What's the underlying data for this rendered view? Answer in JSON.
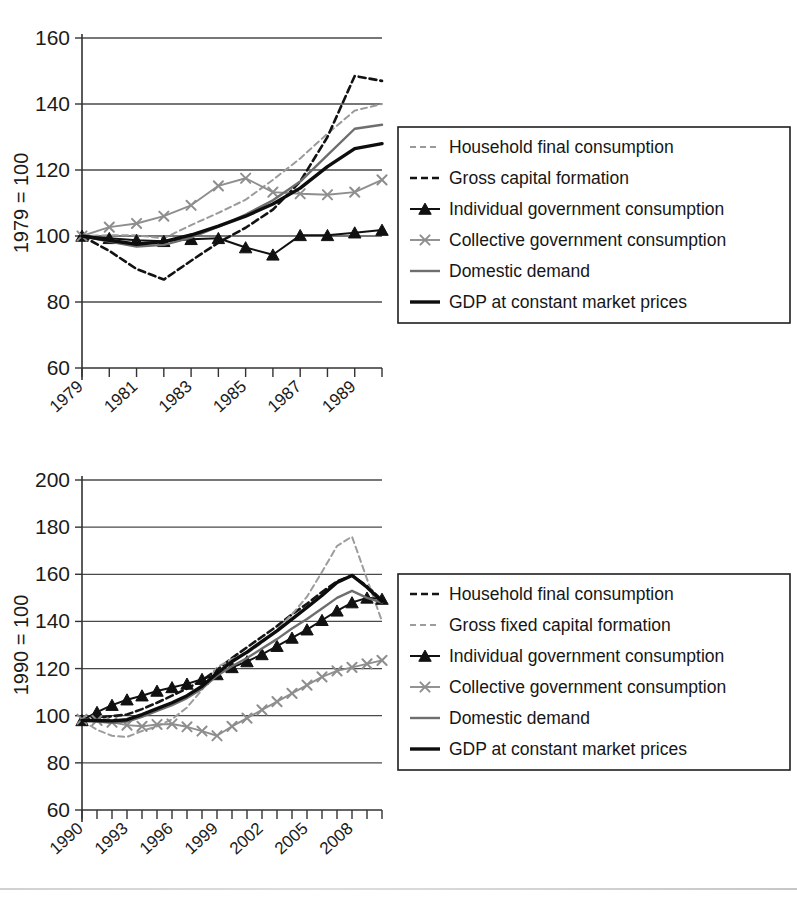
{
  "figure": {
    "background_color": "#ffffff",
    "series_colors": {
      "household": "#9a9a9a",
      "gross_capital": "#121212",
      "individual_gov": "#111111",
      "collective_gov": "#8e8e8e",
      "domestic_demand": "#6e6e6e",
      "gdp": "#0d0d0d"
    }
  },
  "chart_data": [
    {
      "id": "chart-top",
      "type": "line",
      "title": "",
      "xlabel": "",
      "ylabel": "1979 = 100",
      "xlim": [
        1979,
        1990
      ],
      "ylim": [
        60,
        160
      ],
      "yticks": [
        60,
        80,
        100,
        120,
        140,
        160
      ],
      "xticks": [
        1979,
        1980,
        1981,
        1982,
        1983,
        1984,
        1985,
        1986,
        1987,
        1988,
        1989,
        1990
      ],
      "xtick_labels": [
        "1979",
        "",
        "1981",
        "",
        "1983",
        "",
        "1985",
        "",
        "1987",
        "",
        "1989",
        ""
      ],
      "grid": "horizontal",
      "legend_position": "right",
      "x": [
        1979,
        1980,
        1981,
        1982,
        1983,
        1984,
        1985,
        1986,
        1987,
        1988,
        1989,
        1990
      ],
      "series": [
        {
          "name": "Household final consumption",
          "key": "household",
          "style": "dashed-light",
          "color": "#9a9a9a",
          "values": [
            100.0,
            100.2,
            100.2,
            99.3,
            103.3,
            107.0,
            111.0,
            117.0,
            123.5,
            131.0,
            138.0,
            140.0
          ]
        },
        {
          "name": "Gross capital formation",
          "key": "gross_capital",
          "style": "dashed-dark",
          "color": "#121212",
          "values": [
            100.0,
            95.5,
            90.0,
            86.8,
            92.5,
            98.0,
            102.5,
            108.0,
            116.5,
            130.0,
            148.5,
            147.0
          ]
        },
        {
          "name": "Individual government consumption",
          "key": "individual_gov",
          "style": "triangle",
          "color": "#111111",
          "values": [
            100.0,
            99.3,
            98.7,
            98.4,
            99.0,
            99.3,
            96.5,
            94.3,
            100.2,
            100.2,
            101.0,
            101.8,
            103.0
          ]
        },
        {
          "name": "Collective government consumption",
          "key": "collective_gov",
          "style": "cross",
          "color": "#8e8e8e",
          "values": [
            100.0,
            102.7,
            103.8,
            106.0,
            109.3,
            115.2,
            117.5,
            113.3,
            112.8,
            112.5,
            113.3,
            117.0
          ]
        },
        {
          "name": "Domestic demand",
          "key": "domestic_demand",
          "style": "solid-medium",
          "color": "#6e6e6e",
          "values": [
            100.0,
            98.3,
            96.8,
            97.3,
            99.5,
            102.8,
            106.5,
            110.8,
            116.5,
            124.5,
            132.5,
            133.7
          ]
        },
        {
          "name": "GDP at constant market prices",
          "key": "gdp",
          "style": "solid-heavy",
          "color": "#0d0d0d",
          "values": [
            100.0,
            98.7,
            97.5,
            98.3,
            100.3,
            103.0,
            106.0,
            109.7,
            114.5,
            121.0,
            126.5,
            128.0
          ]
        }
      ]
    },
    {
      "id": "chart-bottom",
      "type": "line",
      "title": "",
      "xlabel": "",
      "ylabel": "1990 = 100",
      "xlim": [
        1990,
        2010
      ],
      "ylim": [
        60,
        200
      ],
      "yticks": [
        60,
        80,
        100,
        120,
        140,
        160,
        180,
        200
      ],
      "xticks": [
        1990,
        1991,
        1992,
        1993,
        1994,
        1995,
        1996,
        1997,
        1998,
        1999,
        2000,
        2001,
        2002,
        2003,
        2004,
        2005,
        2006,
        2007,
        2008,
        2009,
        2010
      ],
      "xtick_labels": [
        "1990",
        "",
        "",
        "1993",
        "",
        "",
        "1996",
        "",
        "",
        "1999",
        "",
        "",
        "2002",
        "",
        "",
        "2005",
        "",
        "",
        "2008",
        "",
        ""
      ],
      "grid": "horizontal",
      "legend_position": "right",
      "x": [
        1990,
        1991,
        1992,
        1993,
        1994,
        1995,
        1996,
        1997,
        1998,
        1999,
        2000,
        2001,
        2002,
        2003,
        2004,
        2005,
        2006,
        2007,
        2008,
        2009,
        2010
      ],
      "series": [
        {
          "name": "Household final consumption",
          "key": "household",
          "style": "dashed-dark",
          "color": "#151515",
          "values": [
            98.0,
            99.0,
            99.8,
            100.5,
            102.8,
            105.5,
            108.5,
            111.5,
            115.0,
            119.5,
            124.5,
            129.0,
            133.5,
            138.0,
            143.0,
            147.5,
            152.5,
            157.0,
            159.5,
            155.0,
            149.0
          ]
        },
        {
          "name": "Gross fixed capital formation",
          "key": "gross_capital",
          "style": "dashed-light",
          "color": "#9c9c9c",
          "values": [
            98.0,
            94.0,
            91.5,
            91.0,
            93.5,
            95.5,
            98.5,
            103.5,
            111.0,
            120.5,
            124.0,
            126.5,
            131.0,
            136.5,
            143.0,
            150.5,
            161.0,
            172.0,
            176.0,
            158.0,
            140.0
          ]
        },
        {
          "name": "Individual government consumption",
          "key": "individual_gov",
          "style": "triangle",
          "color": "#111111",
          "values": [
            98.0,
            101.5,
            104.5,
            106.8,
            108.5,
            110.5,
            112.0,
            113.5,
            115.5,
            117.5,
            120.5,
            123.0,
            126.0,
            129.5,
            133.0,
            136.5,
            140.5,
            144.5,
            148.0,
            150.0,
            149.5
          ]
        },
        {
          "name": "Collective government consumption",
          "key": "collective_gov",
          "style": "cross",
          "color": "#8e8e8e",
          "values": [
            98.5,
            98.0,
            97.2,
            96.0,
            95.5,
            96.3,
            96.5,
            95.3,
            93.5,
            91.5,
            95.5,
            99.0,
            102.5,
            106.0,
            109.5,
            113.0,
            116.5,
            119.0,
            120.5,
            122.0,
            123.5
          ]
        },
        {
          "name": "Domestic demand",
          "key": "domestic_demand",
          "style": "solid-medium",
          "color": "#6e6e6e",
          "values": [
            98.0,
            97.5,
            97.0,
            97.5,
            99.5,
            102.0,
            104.5,
            107.5,
            111.5,
            117.0,
            121.0,
            124.5,
            128.5,
            132.5,
            137.0,
            141.0,
            145.5,
            150.0,
            153.0,
            150.0,
            148.0
          ]
        },
        {
          "name": "GDP at constant market prices",
          "key": "gdp",
          "style": "solid-heavy",
          "color": "#0d0d0d",
          "values": [
            98.0,
            98.0,
            97.8,
            98.3,
            100.5,
            103.0,
            105.5,
            108.5,
            112.5,
            118.0,
            123.0,
            127.0,
            131.5,
            136.0,
            141.0,
            146.0,
            151.0,
            156.5,
            159.5,
            154.5,
            148.5
          ]
        }
      ]
    }
  ],
  "legends": [
    {
      "id": "legend-top",
      "items": [
        {
          "label": "Household final consumption",
          "style": "dashed-light",
          "color": "#9a9a9a"
        },
        {
          "label": "Gross capital formation",
          "style": "dashed-dark",
          "color": "#121212"
        },
        {
          "label": "Individual government consumption",
          "style": "triangle",
          "color": "#111111"
        },
        {
          "label": "Collective government consumption",
          "style": "cross",
          "color": "#8e8e8e"
        },
        {
          "label": "Domestic demand",
          "style": "solid-medium",
          "color": "#6e6e6e"
        },
        {
          "label": "GDP at constant market prices",
          "style": "solid-heavy",
          "color": "#0d0d0d"
        }
      ]
    },
    {
      "id": "legend-bottom",
      "items": [
        {
          "label": "Household final consumption",
          "style": "dashed-dark",
          "color": "#151515"
        },
        {
          "label": "Gross fixed capital formation",
          "style": "dashed-light",
          "color": "#9c9c9c"
        },
        {
          "label": "Individual government consumption",
          "style": "triangle",
          "color": "#111111"
        },
        {
          "label": "Collective government consumption",
          "style": "cross",
          "color": "#8e8e8e"
        },
        {
          "label": "Domestic demand",
          "style": "solid-medium",
          "color": "#6e6e6e"
        },
        {
          "label": "GDP at constant market prices",
          "style": "solid-heavy",
          "color": "#0d0d0d"
        }
      ]
    }
  ]
}
